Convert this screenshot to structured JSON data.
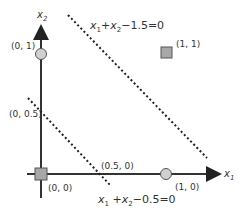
{
  "axes": {
    "x_label": "x",
    "x_sub": "1",
    "y_label": "x",
    "y_sub": "2"
  },
  "points": [
    {
      "label": "(0, 0)",
      "shape": "square",
      "class": 0
    },
    {
      "label": "(1, 1)",
      "shape": "square",
      "class": 0
    },
    {
      "label": "(0, 1)",
      "shape": "circle",
      "class": 1
    },
    {
      "label": "(1, 0)",
      "shape": "circle",
      "class": 1
    }
  ],
  "intercepts": [
    {
      "label": "(0, 0.5)"
    },
    {
      "label": "(0.5, 0)"
    }
  ],
  "lines": [
    {
      "equation": "x1 + x2 − 1.5 = 0",
      "rest": "−1.5=0",
      "style": "dotted"
    },
    {
      "equation": "x1 + x2 − 0.5 = 0",
      "rest": "−0.5=0",
      "style": "dotted"
    }
  ],
  "colors": {
    "axis": "#333333",
    "marker_fill": "#a8a8a8",
    "circle_fill": "#d0d0d0",
    "line": "#222222"
  }
}
